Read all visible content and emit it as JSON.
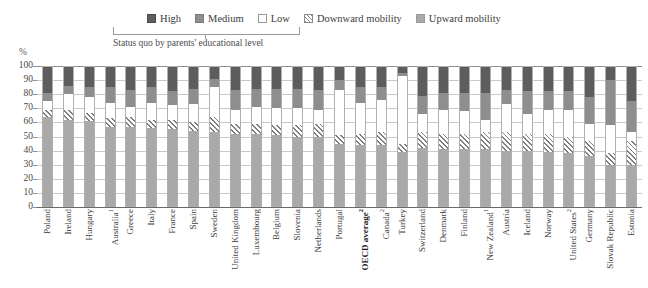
{
  "legend": {
    "items": [
      {
        "key": "high",
        "label": "High",
        "swatch": "high-swatch",
        "color": "#5d5d5d"
      },
      {
        "key": "medium",
        "label": "Medium",
        "swatch": "medium-swatch",
        "color": "#8e8e8e"
      },
      {
        "key": "low",
        "label": "Low",
        "swatch": "low-swatch",
        "color": "#ffffff"
      },
      {
        "key": "downward",
        "label": "Downward mobility",
        "swatch": "downward-mobility-swatch",
        "color": "#8a8a8a"
      },
      {
        "key": "upward",
        "label": "Upward mobility",
        "swatch": "upward-mobility-swatch",
        "color": "#a9a9a9"
      }
    ],
    "bracket_note": "Status quo by parents' educational level"
  },
  "axis": {
    "y_unit": "%",
    "y_ticks": [
      "100",
      "90",
      "80",
      "70",
      "60",
      "50",
      "40",
      "30",
      "20",
      "10",
      "0"
    ]
  },
  "chart_data": {
    "type": "bar",
    "title": "",
    "subtitle": "",
    "xlabel": "",
    "ylabel": "%",
    "ylim": [
      0,
      100
    ],
    "stacked": true,
    "stack_order_bottom_to_top": [
      "Upward mobility",
      "Downward mobility",
      "Low",
      "Medium",
      "High"
    ],
    "grid": true,
    "legend_position": "top-center",
    "categories": [
      "Poland",
      "Ireland",
      "Hungary",
      "Australia",
      "Greece",
      "Italy",
      "France",
      "Spain",
      "Sweden",
      "United Kingdom",
      "Luxembourg",
      "Belgium",
      "Slovenia",
      "Netherlands",
      "Portugal",
      "OECD average",
      "Canada",
      "Turkey",
      "Switzerland",
      "Denmark",
      "Finland",
      "New Zealand",
      "Austria",
      "Iceland",
      "Norway",
      "United States",
      "Germany",
      "Slovak Republic",
      "Estonia"
    ],
    "category_footnotes": {
      "Australia": "1",
      "OECD average": "2",
      "Canada": "2",
      "New Zealand": "1",
      "United States": "2"
    },
    "highlight_category": "OECD average",
    "series": [
      {
        "name": "Upward mobility",
        "color": "#a9a9a9",
        "values": [
          64,
          62,
          61,
          57,
          57,
          56,
          55,
          54,
          53,
          52,
          52,
          51,
          50,
          50,
          45,
          44,
          44,
          39,
          42,
          41,
          41,
          41,
          40,
          40,
          39,
          38,
          36,
          30,
          30
        ]
      },
      {
        "name": "Downward mobility",
        "color": "#8a8a8a",
        "pattern": "diagonal-hatch",
        "values": [
          5,
          7,
          6,
          6,
          7,
          6,
          7,
          6,
          11,
          7,
          7,
          7,
          8,
          9,
          6,
          8,
          9,
          6,
          11,
          11,
          11,
          12,
          13,
          12,
          13,
          12,
          11,
          8,
          17
        ]
      },
      {
        "name": "Low",
        "color": "#ffffff",
        "values": [
          6,
          11,
          11,
          11,
          7,
          12,
          10,
          13,
          21,
          10,
          12,
          12,
          12,
          10,
          32,
          22,
          23,
          48,
          13,
          17,
          16,
          9,
          20,
          14,
          17,
          19,
          12,
          20,
          6
        ]
      },
      {
        "name": "Medium",
        "color": "#8e8e8e",
        "values": [
          6,
          6,
          7,
          11,
          12,
          11,
          10,
          11,
          6,
          14,
          13,
          14,
          14,
          14,
          7,
          11,
          9,
          2,
          13,
          12,
          13,
          19,
          10,
          16,
          13,
          13,
          19,
          32,
          22
        ]
      },
      {
        "name": "High",
        "color": "#5d5d5d",
        "values": [
          19,
          14,
          15,
          15,
          17,
          15,
          18,
          16,
          9,
          17,
          16,
          16,
          16,
          17,
          10,
          15,
          15,
          5,
          21,
          19,
          19,
          19,
          17,
          18,
          18,
          18,
          22,
          10,
          25
        ]
      }
    ]
  }
}
